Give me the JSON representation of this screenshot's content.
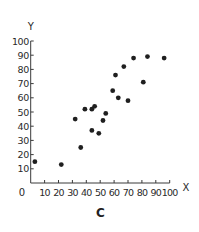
{
  "chart_data": {
    "type": "scatter",
    "title": "",
    "caption": "C",
    "xlabel": "X",
    "ylabel": "Y",
    "xlim": [
      0,
      100
    ],
    "ylim": [
      0,
      100
    ],
    "xticks": [
      0,
      10,
      20,
      30,
      40,
      50,
      60,
      70,
      80,
      90,
      100
    ],
    "yticks": [
      10,
      20,
      30,
      40,
      50,
      60,
      70,
      80,
      90,
      100
    ],
    "grid": false,
    "legend": null,
    "points": [
      {
        "x": 3,
        "y": 15
      },
      {
        "x": 22,
        "y": 13
      },
      {
        "x": 32,
        "y": 45
      },
      {
        "x": 36,
        "y": 25
      },
      {
        "x": 39,
        "y": 52
      },
      {
        "x": 44,
        "y": 52
      },
      {
        "x": 46,
        "y": 54
      },
      {
        "x": 44,
        "y": 37
      },
      {
        "x": 49,
        "y": 35
      },
      {
        "x": 52,
        "y": 44
      },
      {
        "x": 54,
        "y": 49
      },
      {
        "x": 59,
        "y": 65
      },
      {
        "x": 61,
        "y": 76
      },
      {
        "x": 63,
        "y": 60
      },
      {
        "x": 67,
        "y": 82
      },
      {
        "x": 70,
        "y": 58
      },
      {
        "x": 74,
        "y": 88
      },
      {
        "x": 81,
        "y": 71
      },
      {
        "x": 84,
        "y": 89
      },
      {
        "x": 96,
        "y": 88
      }
    ],
    "colors": {
      "axis": "#3a3a3a",
      "point": "#1f1f1f",
      "text": "#2a2a2a"
    }
  },
  "labels": {
    "caption": "C",
    "x_axis_label": "X",
    "y_axis_label": "Y",
    "origin_label": "0"
  }
}
